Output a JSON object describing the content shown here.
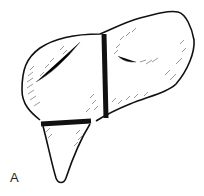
{
  "figure": {
    "panel_label": "A",
    "colors": {
      "stroke": "#111111",
      "fill": "#ffffff",
      "hatch": "#555555"
    }
  }
}
